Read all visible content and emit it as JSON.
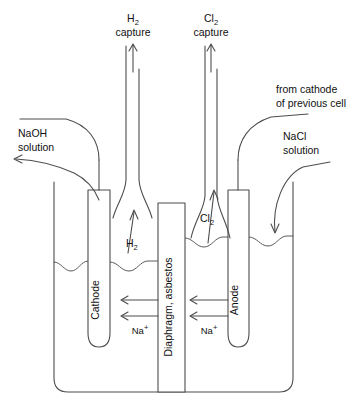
{
  "diagram": {
    "labels": {
      "h2_capture_line1": "H",
      "h2_capture_sub": "2",
      "h2_capture_line2": "capture",
      "cl2_capture_line1": "Cl",
      "cl2_capture_sub": "2",
      "cl2_capture_line2": "capture",
      "from_cathode_line1": "from cathode",
      "from_cathode_line2": "of previous cell",
      "nacl_line1": "NaCl",
      "nacl_line2": "solution",
      "naoh_line1": "NaOH",
      "naoh_line2": "solution",
      "cathode": "Cathode",
      "anode": "Anode",
      "diaphragm": "Diaphragm, asbestos",
      "h2_gas": "H",
      "h2_gas_sub": "2",
      "cl2_gas": "Cl",
      "cl2_gas_sub": "2",
      "sodium_ion_left": "Na",
      "sodium_ion_left_sup": "+",
      "sodium_ion_right": "Na",
      "sodium_ion_right_sup": "+"
    },
    "colors": {
      "stroke": "#4d4d4d",
      "text": "#111111",
      "background": "#ffffff"
    }
  }
}
